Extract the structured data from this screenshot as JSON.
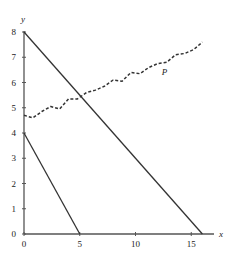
{
  "chart_data": {
    "type": "line",
    "title": "",
    "xlabel": "x",
    "ylabel": "y",
    "xlim": [
      0,
      17
    ],
    "ylim": [
      0,
      8.3
    ],
    "xticks": [
      0,
      5,
      10,
      15
    ],
    "yticks": [
      0,
      1,
      2,
      3,
      4,
      5,
      6,
      7,
      8
    ],
    "grid": false,
    "legend": null,
    "series": [
      {
        "name": "line-upper",
        "style": "solid",
        "points": [
          [
            0,
            8
          ],
          [
            16,
            0
          ]
        ]
      },
      {
        "name": "line-lower",
        "style": "solid",
        "points": [
          [
            0,
            4
          ],
          [
            5,
            0
          ]
        ]
      },
      {
        "name": "P",
        "style": "dashed-wavy",
        "points": [
          [
            0,
            4.7
          ],
          [
            0.8,
            4.6
          ],
          [
            1.6,
            4.85
          ],
          [
            2.4,
            5.05
          ],
          [
            3.2,
            4.95
          ],
          [
            4.0,
            5.35
          ],
          [
            4.8,
            5.35
          ],
          [
            5.6,
            5.6
          ],
          [
            6.4,
            5.7
          ],
          [
            7.2,
            5.85
          ],
          [
            8.0,
            6.1
          ],
          [
            8.8,
            6.05
          ],
          [
            9.6,
            6.4
          ],
          [
            10.4,
            6.35
          ],
          [
            11.2,
            6.6
          ],
          [
            12.0,
            6.75
          ],
          [
            12.8,
            6.8
          ],
          [
            13.6,
            7.1
          ],
          [
            14.4,
            7.15
          ],
          [
            15.2,
            7.3
          ],
          [
            16.0,
            7.6
          ]
        ]
      }
    ],
    "annotations": [
      {
        "text": "P",
        "x": 12.6,
        "y": 6.3
      }
    ]
  },
  "labels": {
    "x_axis": "x",
    "y_axis": "y",
    "curve_p": "P",
    "x_ticks": [
      "0",
      "5",
      "10",
      "15"
    ],
    "y_ticks": [
      "0",
      "1",
      "2",
      "3",
      "4",
      "5",
      "6",
      "7",
      "8"
    ]
  }
}
